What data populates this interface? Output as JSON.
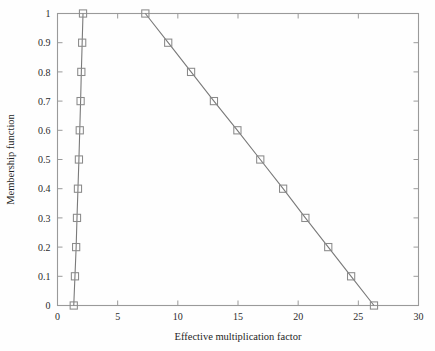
{
  "chart_data": {
    "type": "line",
    "title": "",
    "subtitle": "",
    "xlabel": "Effective multiplication factor",
    "ylabel": "Membership function",
    "xlim": [
      0,
      30
    ],
    "ylim": [
      0,
      1
    ],
    "xticks": [
      0,
      5,
      10,
      15,
      20,
      25,
      30
    ],
    "xtick_labels": [
      "0",
      "5",
      "10",
      "15",
      "20",
      "25",
      "30"
    ],
    "yticks": [
      0,
      0.1,
      0.2,
      0.3,
      0.4,
      0.5,
      0.6,
      0.7,
      0.8,
      0.9,
      1
    ],
    "ytick_labels": [
      "0",
      "0.1",
      "0.2",
      "0.3",
      "0.4",
      "0.5",
      "0.6",
      "0.7",
      "0.8",
      "0.9",
      "1"
    ],
    "grid": false,
    "legend": false,
    "legend_position": "none",
    "marker": "square-open",
    "line_color": "#7a7a7a",
    "marker_color": "#8a8a8a",
    "axis_color": "#9a9a9a",
    "series": [
      {
        "name": "left-branch",
        "x": [
          1.35,
          1.45,
          1.55,
          1.62,
          1.7,
          1.78,
          1.85,
          1.92,
          1.98,
          2.05,
          2.12
        ],
        "y": [
          0,
          0.1,
          0.2,
          0.3,
          0.4,
          0.5,
          0.6,
          0.7,
          0.8,
          0.9,
          1
        ]
      },
      {
        "name": "right-branch",
        "x": [
          7.3,
          9.2,
          11.1,
          13.0,
          14.95,
          16.85,
          18.75,
          20.6,
          22.5,
          24.4,
          26.3
        ],
        "y": [
          1,
          0.9,
          0.8,
          0.7,
          0.6,
          0.5,
          0.4,
          0.3,
          0.2,
          0.1,
          0
        ]
      }
    ]
  }
}
